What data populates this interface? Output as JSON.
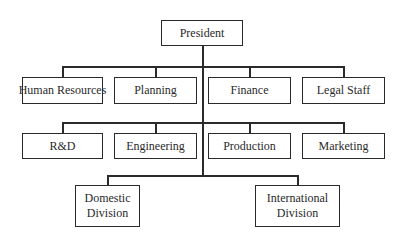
{
  "diagram": {
    "type": "org-chart",
    "colors": {
      "line": "#2a2a2a",
      "box_border": "#2a2a2a",
      "background": "#ffffff",
      "text": "#2a2a2a"
    },
    "root": {
      "label": "President"
    },
    "staff_row": [
      {
        "label": "Human Resources"
      },
      {
        "label": "Planning"
      },
      {
        "label": "Finance"
      },
      {
        "label": "Legal Staff"
      }
    ],
    "function_row": [
      {
        "label": "R&D"
      },
      {
        "label": "Engineering"
      },
      {
        "label": "Production"
      },
      {
        "label": "Marketing"
      }
    ],
    "divisions": [
      {
        "line1": "Domestic",
        "line2": "Division"
      },
      {
        "line1": "International",
        "line2": "Division"
      }
    ]
  }
}
